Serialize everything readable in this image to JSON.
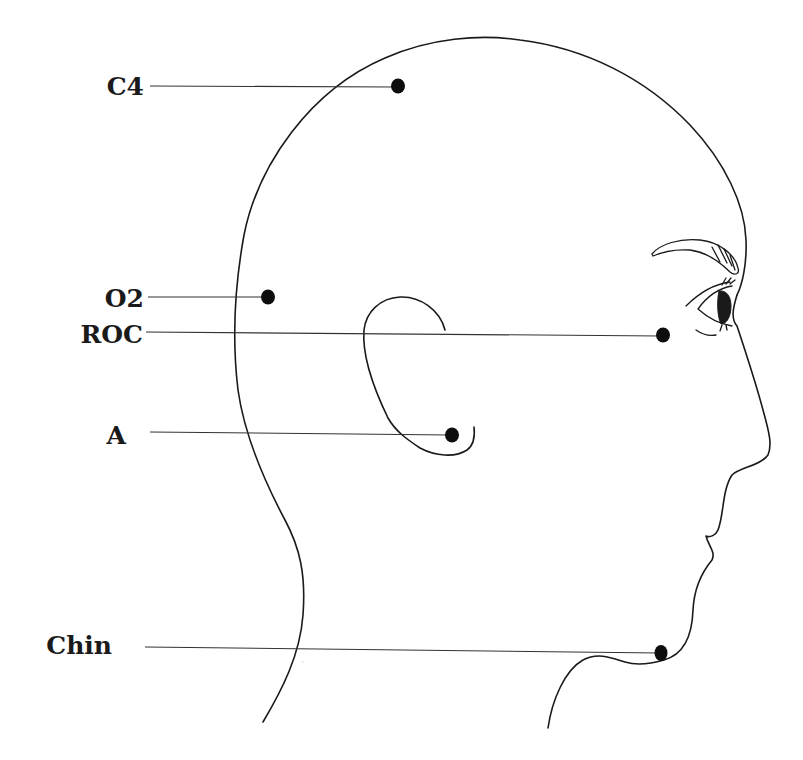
{
  "figure": {
    "colors": {
      "background": "#ffffff",
      "line": "#1a1a1a",
      "electrode": "#0d0d0d"
    },
    "electrodes": [
      {
        "label": "C4",
        "label_x": 11,
        "label_y": 74,
        "dot_x": 398,
        "dot_y": 86,
        "line_start_x": 150,
        "line_start_y": 86
      },
      {
        "label": "O2",
        "label_x": 11,
        "label_y": 286,
        "dot_x": 268,
        "dot_y": 297,
        "line_start_x": 148,
        "line_start_y": 297
      },
      {
        "label": "ROC",
        "label_x": 11,
        "label_y": 325,
        "dot_x": 663,
        "dot_y": 335,
        "line_start_x": 146,
        "line_start_y": 332
      },
      {
        "label": "A",
        "label_x": 0,
        "label_y": 423,
        "dot_x": 452,
        "dot_y": 435,
        "line_start_x": 150,
        "line_start_y": 432
      },
      {
        "label": "Chin",
        "label_x": -17,
        "label_y": 633,
        "dot_x": 661,
        "dot_y": 653,
        "line_start_x": 145,
        "line_start_y": 647
      }
    ]
  }
}
